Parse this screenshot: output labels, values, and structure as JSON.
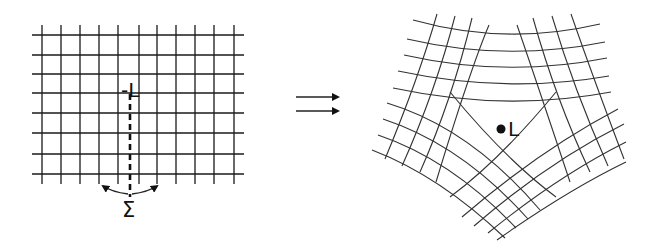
{
  "figure": {
    "left_panel": {
      "line_label": "-L",
      "cut_label": "Σ",
      "grid": {
        "vertical_x": [
          42,
          61,
          80,
          99,
          118,
          139,
          157,
          176,
          195,
          214,
          234
        ],
        "horizontal_y": [
          35,
          55,
          74,
          93,
          113,
          133,
          154,
          174
        ],
        "x_min": 32,
        "x_max": 244,
        "y_min": 25,
        "y_max": 184
      },
      "cut": {
        "x": 130,
        "y_top": 94,
        "y_bottom": 197
      },
      "rotation_arrows": [
        {
          "path": "M128,194 Q112,192 103,186",
          "head": [
            103,
            186
          ]
        },
        {
          "path": "M132,194 Q148,192 157,186",
          "head": [
            157,
            186
          ]
        }
      ]
    },
    "transition_arrows": {
      "count": 2,
      "symbol": "⇉",
      "lines": [
        {
          "x1": 296,
          "x2": 338,
          "y": 97
        },
        {
          "x1": 296,
          "x2": 338,
          "y": 111
        }
      ]
    },
    "right_panel": {
      "point_label": "L",
      "point": {
        "x": 501,
        "y": 129
      },
      "paths": [
        "M413,20 Q506,46 600,24",
        "M407,39 Q506,62 605,42",
        "M404,55 Q506,78 607,58",
        "M398,71 Q506,94 609,76",
        "M393,88 Q506,112 611,92",
        "M437,14 Q418,80 385,159",
        "M455,16 Q436,90 402,166",
        "M472,18 Q452,100 420,172",
        "M489,25 Q470,70 436,182",
        "M517,25 Q536,80 570,182",
        "M533,18 Q556,100 590,172",
        "M552,16 Q574,90 608,166",
        "M571,14 Q594,80 624,159",
        "M387,103 Q470,128 540,210",
        "M383,119 Q462,145 528,219",
        "M378,135 Q452,160 516,228",
        "M372,150 Q440,176 505,238",
        "M462,217 Q540,150 618,109",
        "M474,226 Q548,162 624,124",
        "M488,233 Q558,176 626,142",
        "M497,240 Q568,190 626,162",
        "M450,197 Q500,160 556,92",
        "M556,197 Q506,160 450,92"
      ]
    }
  }
}
